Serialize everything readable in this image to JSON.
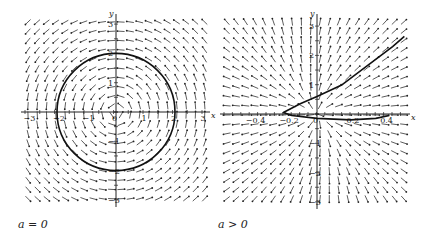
{
  "chart_data": [
    {
      "type": "direction_field",
      "caption": "a = 0",
      "xlabel": "x",
      "ylabel": "y",
      "xlim": [
        -3,
        3
      ],
      "ylim": [
        -3,
        3
      ],
      "xticks": [
        "-3",
        "-2",
        "-1",
        "0",
        "1",
        "2",
        "3"
      ],
      "yticks": [
        "-3",
        "-2",
        "-1",
        "1",
        "2",
        "3"
      ],
      "origin_label": "0",
      "curve": {
        "shape": "circle",
        "center": [
          0,
          0
        ],
        "radius": 2
      },
      "field": "rotational (counterclockwise circles about origin)"
    },
    {
      "type": "direction_field",
      "caption": "a > 0",
      "xlabel": "x",
      "ylabel": "y",
      "xlim": [
        -0.5,
        0.5
      ],
      "ylim": [
        -3,
        3
      ],
      "xticks": [
        "-0.4",
        "-0.2",
        "0",
        "0.2",
        "0.4"
      ],
      "yticks": [
        "-3",
        "-2",
        "-1",
        "1",
        "2",
        "3"
      ],
      "curve": {
        "shape": "trajectory",
        "points": [
          [
            0.43,
            -0.05
          ],
          [
            0.35,
            -0.15
          ],
          [
            0.2,
            -0.2
          ],
          [
            0,
            -0.15
          ],
          [
            -0.15,
            -0.05
          ],
          [
            -0.2,
            0.05
          ],
          [
            -0.1,
            0.35
          ],
          [
            0,
            0.6
          ],
          [
            0.15,
            1.0
          ],
          [
            0.3,
            1.65
          ],
          [
            0.45,
            2.3
          ],
          [
            0.52,
            2.65
          ]
        ]
      },
      "field": "saddle-like flow, arrows outward away from origin"
    }
  ],
  "captions": {
    "left": "a = 0",
    "right": "a > 0"
  }
}
